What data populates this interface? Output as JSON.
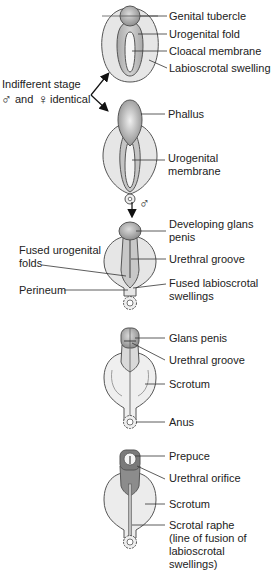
{
  "diagram": {
    "colors": {
      "outline": "#555555",
      "light_fill": "#e6e6e6",
      "mid_fill": "#bdbdbd",
      "dark_fill": "#8c8c8c",
      "leader": "#333333",
      "text": "#222222"
    },
    "side_note": {
      "line1": "Indifferent stage",
      "line2_male_symbol": "♂",
      "line2_and": "and",
      "line2_female_symbol": "♀",
      "line2_identical": "identical"
    },
    "male_arrow_symbol": "♂",
    "stages": [
      {
        "name": "indifferent-stage-early",
        "labels": [
          "Genital tubercle",
          "Urogenital fold",
          "Cloacal membrane",
          "Labioscrotal swelling"
        ]
      },
      {
        "name": "indifferent-stage-late",
        "labels": [
          "Phallus",
          "Urogenital",
          "membrane"
        ]
      },
      {
        "name": "male-early",
        "labels_right": [
          "Developing glans",
          "penis",
          "Urethral groove",
          "Fused labioscrotal",
          "swellings"
        ],
        "labels_left": [
          "Fused urogenital",
          "folds",
          "Perineum"
        ]
      },
      {
        "name": "male-mid",
        "labels": [
          "Glans penis",
          "Urethral groove",
          "Scrotum",
          "Anus"
        ]
      },
      {
        "name": "male-late",
        "labels": [
          "Prepuce",
          "Urethral orifice",
          "Scrotum",
          "Scrotal raphe",
          "(line of fusion of",
          "labioscrotal",
          "swellings)"
        ]
      }
    ]
  }
}
